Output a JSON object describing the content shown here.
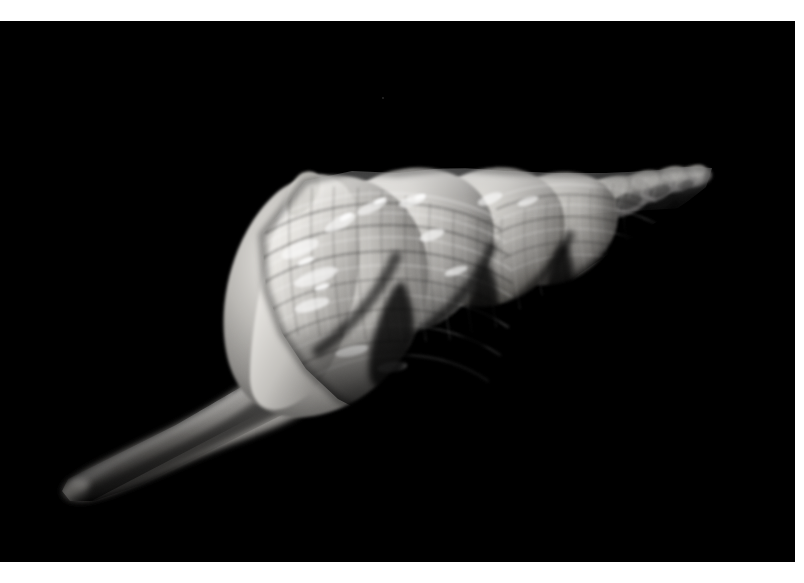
{
  "image": {
    "kind": "photograph",
    "subject": "gastropod-seashell",
    "common_name": "Murex / whelk sea shell",
    "description": "Black and white macro photograph of a spiral sea shell on a pure black background. The shell is oriented diagonally with the pointed apex at the upper right and the long tapering siphonal canal extending to the lower left.",
    "color_mode": "grayscale",
    "orientation": "landscape",
    "width_px": 804,
    "height_px": 583
  },
  "canvas": {
    "page_background": "#ffffff",
    "photo_background": "#000000",
    "photo_left": 0,
    "photo_top": 21,
    "photo_width": 795,
    "photo_height": 541,
    "margin_top": 21,
    "margin_right": 9,
    "margin_bottom": 21
  },
  "palette": {
    "background": "#000000",
    "shadow_deep": "#0a0a0a",
    "shell_dark": "#3a3a3a",
    "shell_mid_dark": "#6b6b6b",
    "shell_mid": "#9a9a9a",
    "shell_light": "#c4c4c4",
    "shell_highlight": "#e4e4e2",
    "shell_specular": "#f4f4f2",
    "canal_dim": "#5a5a5a",
    "canal_mid": "#8e8e8e"
  },
  "subject": {
    "apex_point": {
      "x": 712,
      "y": 146
    },
    "canal_tip": {
      "x": 63,
      "y": 477
    },
    "body_whorl_center": {
      "x": 400,
      "y": 265
    },
    "bounding_box": {
      "x": 60,
      "y": 140,
      "width": 655,
      "height": 262
    },
    "axis_angle_deg": -22,
    "light_direction": "upper-left",
    "whorl_count": 8
  },
  "chart_data": {
    "type": "scatter",
    "xlabel": "x (px)",
    "ylabel": "y (px)",
    "whorls": [
      {
        "index": 1,
        "name": "apex-nucleus",
        "cx": 700,
        "cy": 150,
        "rx": 14,
        "ry": 11,
        "brightness": 0.62
      },
      {
        "index": 2,
        "name": "whorl-2",
        "cx": 676,
        "cy": 153,
        "rx": 18,
        "ry": 14,
        "brightness": 0.64
      },
      {
        "index": 3,
        "name": "whorl-3",
        "cx": 645,
        "cy": 160,
        "rx": 25,
        "ry": 20,
        "brightness": 0.66
      },
      {
        "index": 4,
        "name": "whorl-4",
        "cx": 601,
        "cy": 176,
        "rx": 36,
        "ry": 32,
        "brightness": 0.68
      },
      {
        "index": 5,
        "name": "whorl-5",
        "cx": 530,
        "cy": 203,
        "rx": 50,
        "ry": 46,
        "brightness": 0.7
      },
      {
        "index": 6,
        "name": "whorl-6",
        "cx": 447,
        "cy": 238,
        "rx": 62,
        "ry": 60,
        "brightness": 0.76
      },
      {
        "index": 7,
        "name": "whorl-7-varix",
        "cx": 355,
        "cy": 270,
        "rx": 68,
        "ry": 70,
        "brightness": 0.82
      },
      {
        "index": 8,
        "name": "body-whorl-lip",
        "cx": 310,
        "cy": 262,
        "rx": 50,
        "ry": 66,
        "brightness": 0.86
      }
    ],
    "siphonal_canal": {
      "start": {
        "x": 290,
        "y": 330
      },
      "end": {
        "x": 66,
        "y": 472
      },
      "start_radius": 30,
      "end_radius": 11,
      "rib_count": 14
    }
  }
}
